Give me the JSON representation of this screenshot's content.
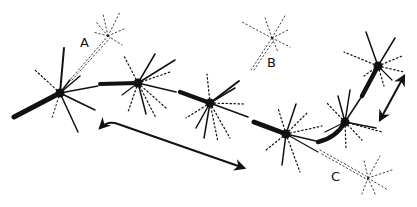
{
  "diagram": {
    "type": "neuron-chain-illustration",
    "colors": {
      "ink": "#111111",
      "background": "#ffffff"
    },
    "labels": [
      {
        "id": "A",
        "text": "A",
        "x": 80,
        "y": 36
      },
      {
        "id": "B",
        "text": "B",
        "x": 267,
        "y": 56
      },
      {
        "id": "C",
        "text": "C",
        "x": 331,
        "y": 170
      }
    ],
    "neurons": [
      {
        "id": "n1",
        "x": 60,
        "y": 93,
        "size": "large"
      },
      {
        "id": "n2",
        "x": 138,
        "y": 83,
        "size": "large"
      },
      {
        "id": "n3",
        "x": 210,
        "y": 103,
        "size": "large"
      },
      {
        "id": "n4",
        "x": 286,
        "y": 134,
        "size": "large"
      },
      {
        "id": "n5",
        "x": 345,
        "y": 122,
        "size": "large"
      },
      {
        "id": "n6",
        "x": 378,
        "y": 66,
        "size": "large"
      },
      {
        "id": "nA",
        "x": 108,
        "y": 36,
        "size": "faint",
        "label": "A"
      },
      {
        "id": "nB",
        "x": 272,
        "y": 38,
        "size": "faint",
        "label": "B"
      },
      {
        "id": "nC",
        "x": 370,
        "y": 180,
        "size": "faint",
        "label": "C"
      }
    ],
    "arrows": [
      {
        "id": "main-flow-arrow",
        "description": "long arrow pointing right-down from lower left curve"
      },
      {
        "id": "upward-arrow",
        "description": "arrow pointing up-right near rightmost neuron"
      }
    ]
  }
}
